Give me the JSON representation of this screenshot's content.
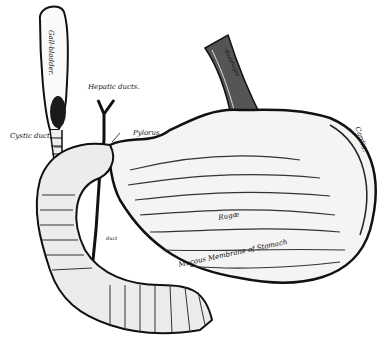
{
  "figure": {
    "background_color": "#ffffff",
    "ink_color": "#111111",
    "labels": {
      "gall_bladder": "Gall-bladder.",
      "hepatic_ducts": "Hepatic ducts.",
      "cystic_duct": "Cystic duct.",
      "pylorus": "Pylorus.",
      "cardia": "Cardia.",
      "esophagus": "Œsophagus",
      "rugae": "Rugæ",
      "mucous_membrane": "Mucous Membrane of Stomach",
      "pancreatic_duct": "duct"
    }
  }
}
